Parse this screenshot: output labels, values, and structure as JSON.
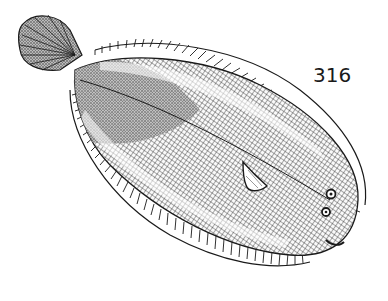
{
  "figure": {
    "number": "316",
    "ink_color": "#1a1a1a",
    "paper_color": "#ffffff"
  }
}
